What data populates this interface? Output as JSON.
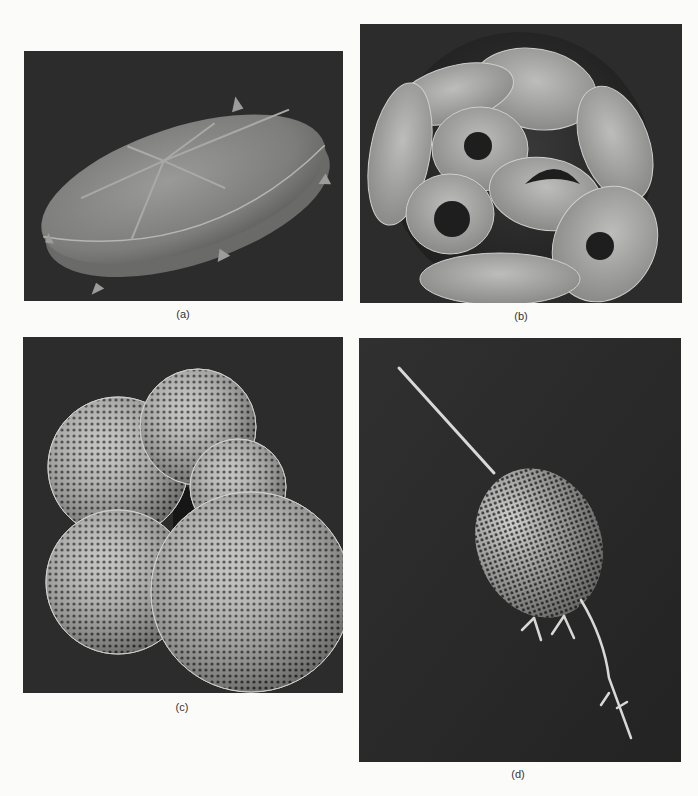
{
  "figure": {
    "panels": [
      {
        "id": "a",
        "label": "(a)",
        "subject": "disc-shaped microfossil with radial ridges and marginal spines",
        "background": "#2c2c2c"
      },
      {
        "id": "b",
        "label": "(b)",
        "subject": "coccosphere composed of overlapping plate-like coccoliths",
        "background": "#2c2c2c"
      },
      {
        "id": "c",
        "label": "(c)",
        "subject": "multi-chambered foraminifera test with pitted surface",
        "background": "#2c2c2c"
      },
      {
        "id": "d",
        "label": "(d)",
        "subject": "lattice-shelled radiolarian with long spines",
        "background": "#2c2c2c"
      }
    ]
  }
}
